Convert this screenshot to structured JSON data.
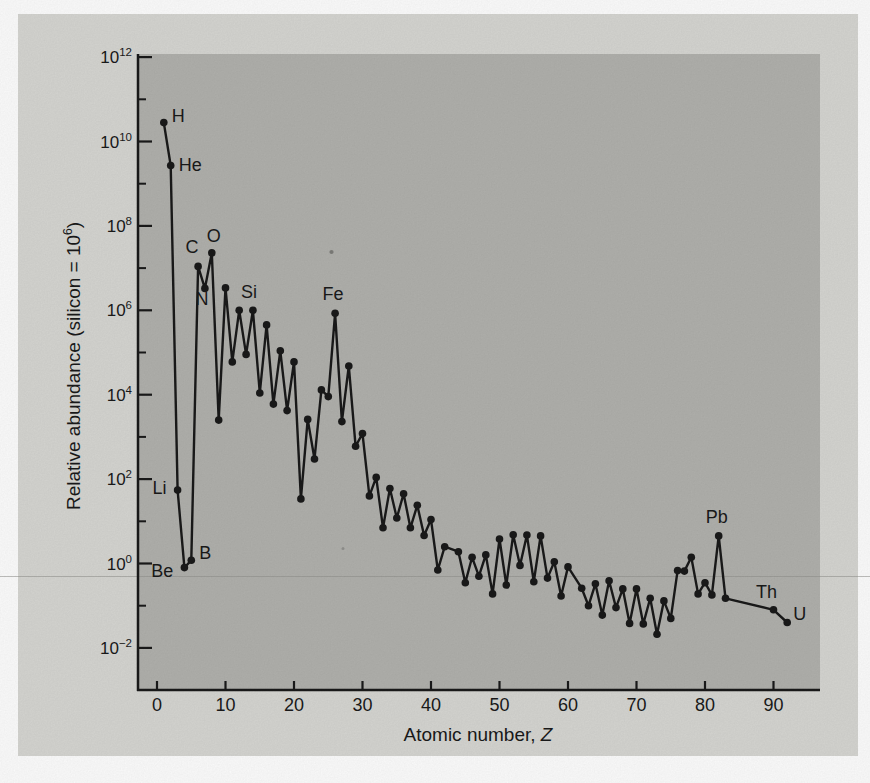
{
  "figure": {
    "kind": "scanned-textbook-figure",
    "colors": {
      "canvas": "#fdfdfd",
      "page": "#d6d6d2",
      "plot": "#b1b1ad",
      "ink": "#1a1a1a",
      "scan_line": "#90908c"
    }
  },
  "chart_data": {
    "type": "line",
    "markers": "filled-circle",
    "title": "",
    "xlabel": "Atomic number, Z",
    "xlabel_parts": {
      "prefix": "Atomic number, ",
      "italic": "Z"
    },
    "ylabel": "Relative abundance (silicon = 10⁶)",
    "ylabel_parts": {
      "prefix": "Relative abundance (silicon = 10",
      "sup": "6",
      "suffix": ")"
    },
    "x_axis": {
      "min": 0,
      "max": 96,
      "tick_interval": 10,
      "ticks": [
        0,
        10,
        20,
        30,
        40,
        50,
        60,
        70,
        80,
        90
      ]
    },
    "y_axis": {
      "scale": "log",
      "base": 10,
      "min": 0.01,
      "max": 1000000000000.0,
      "major_tick_exponents": [
        12,
        10,
        8,
        6,
        4,
        2,
        0,
        -2
      ],
      "minor_tick_exponents": [
        11,
        9,
        7,
        5,
        3,
        1,
        -1
      ]
    },
    "legend": "none",
    "grid": "off",
    "omitted_z": [
      43,
      61,
      84,
      85,
      86,
      87,
      88,
      89,
      91
    ],
    "points": [
      {
        "z": 1,
        "symbol": "H",
        "value": 28000000000.0,
        "label": {
          "anchor": "start",
          "dx": 8,
          "dy": -1
        }
      },
      {
        "z": 2,
        "symbol": "He",
        "value": 2700000000.0,
        "label": {
          "anchor": "start",
          "dx": 8,
          "dy": 5
        }
      },
      {
        "z": 3,
        "symbol": "Li",
        "value": 55,
        "label": {
          "anchor": "end",
          "dx": -11,
          "dy": 4
        }
      },
      {
        "z": 4,
        "symbol": "Be",
        "value": 0.8,
        "label": {
          "anchor": "end",
          "dx": -11,
          "dy": 9
        }
      },
      {
        "z": 5,
        "symbol": "B",
        "value": 1.2,
        "label": {
          "anchor": "start",
          "dx": 8,
          "dy": -1
        }
      },
      {
        "z": 6,
        "symbol": "C",
        "value": 11000000.0,
        "label": {
          "anchor": "middle",
          "dx": -6,
          "dy": -13
        }
      },
      {
        "z": 7,
        "symbol": "N",
        "value": 3300000.0,
        "label": {
          "anchor": "middle",
          "dx": -3,
          "dy": 17
        }
      },
      {
        "z": 8,
        "symbol": "O",
        "value": 23000000.0,
        "label": {
          "anchor": "middle",
          "dx": 2,
          "dy": -11
        }
      },
      {
        "z": 9,
        "symbol": "F",
        "value": 2500
      },
      {
        "z": 10,
        "symbol": "Ne",
        "value": 3400000.0
      },
      {
        "z": 11,
        "symbol": "Na",
        "value": 60000
      },
      {
        "z": 12,
        "symbol": "Mg",
        "value": 1000000.0
      },
      {
        "z": 13,
        "symbol": "Al",
        "value": 90000
      },
      {
        "z": 14,
        "symbol": "Si",
        "value": 1000000.0,
        "label": {
          "anchor": "middle",
          "dx": -4,
          "dy": -12
        }
      },
      {
        "z": 15,
        "symbol": "P",
        "value": 11000
      },
      {
        "z": 16,
        "symbol": "S",
        "value": 450000
      },
      {
        "z": 17,
        "symbol": "Cl",
        "value": 6000
      },
      {
        "z": 18,
        "symbol": "Ar",
        "value": 110000
      },
      {
        "z": 19,
        "symbol": "K",
        "value": 4200
      },
      {
        "z": 20,
        "symbol": "Ca",
        "value": 60000
      },
      {
        "z": 21,
        "symbol": "Sc",
        "value": 34
      },
      {
        "z": 22,
        "symbol": "Ti",
        "value": 2600
      },
      {
        "z": 23,
        "symbol": "V",
        "value": 300
      },
      {
        "z": 24,
        "symbol": "Cr",
        "value": 13000
      },
      {
        "z": 25,
        "symbol": "Mn",
        "value": 9000
      },
      {
        "z": 26,
        "symbol": "Fe",
        "value": 850000.0,
        "label": {
          "anchor": "middle",
          "dx": -2,
          "dy": -13
        }
      },
      {
        "z": 27,
        "symbol": "Co",
        "value": 2300
      },
      {
        "z": 28,
        "symbol": "Ni",
        "value": 48000
      },
      {
        "z": 29,
        "symbol": "Cu",
        "value": 600
      },
      {
        "z": 30,
        "symbol": "Zn",
        "value": 1200
      },
      {
        "z": 31,
        "symbol": "Ga",
        "value": 40
      },
      {
        "z": 32,
        "symbol": "Ge",
        "value": 110
      },
      {
        "z": 33,
        "symbol": "As",
        "value": 7
      },
      {
        "z": 34,
        "symbol": "Se",
        "value": 60
      },
      {
        "z": 35,
        "symbol": "Br",
        "value": 12
      },
      {
        "z": 36,
        "symbol": "Kr",
        "value": 45
      },
      {
        "z": 37,
        "symbol": "Rb",
        "value": 7
      },
      {
        "z": 38,
        "symbol": "Sr",
        "value": 24
      },
      {
        "z": 39,
        "symbol": "Y",
        "value": 4.6
      },
      {
        "z": 40,
        "symbol": "Zr",
        "value": 11
      },
      {
        "z": 41,
        "symbol": "Nb",
        "value": 0.7
      },
      {
        "z": 42,
        "symbol": "Mo",
        "value": 2.5
      },
      {
        "z": 44,
        "symbol": "Ru",
        "value": 1.9
      },
      {
        "z": 45,
        "symbol": "Rh",
        "value": 0.35
      },
      {
        "z": 46,
        "symbol": "Pd",
        "value": 1.4
      },
      {
        "z": 47,
        "symbol": "Ag",
        "value": 0.5
      },
      {
        "z": 48,
        "symbol": "Cd",
        "value": 1.6
      },
      {
        "z": 49,
        "symbol": "In",
        "value": 0.19
      },
      {
        "z": 50,
        "symbol": "Sn",
        "value": 3.8
      },
      {
        "z": 51,
        "symbol": "Sb",
        "value": 0.31
      },
      {
        "z": 52,
        "symbol": "Te",
        "value": 4.8
      },
      {
        "z": 53,
        "symbol": "I",
        "value": 0.9
      },
      {
        "z": 54,
        "symbol": "Xe",
        "value": 4.7
      },
      {
        "z": 55,
        "symbol": "Cs",
        "value": 0.37
      },
      {
        "z": 56,
        "symbol": "Ba",
        "value": 4.5
      },
      {
        "z": 57,
        "symbol": "La",
        "value": 0.45
      },
      {
        "z": 58,
        "symbol": "Ce",
        "value": 1.1
      },
      {
        "z": 59,
        "symbol": "Pr",
        "value": 0.17
      },
      {
        "z": 60,
        "symbol": "Nd",
        "value": 0.83
      },
      {
        "z": 62,
        "symbol": "Sm",
        "value": 0.26
      },
      {
        "z": 63,
        "symbol": "Eu",
        "value": 0.1
      },
      {
        "z": 64,
        "symbol": "Gd",
        "value": 0.33
      },
      {
        "z": 65,
        "symbol": "Tb",
        "value": 0.06
      },
      {
        "z": 66,
        "symbol": "Dy",
        "value": 0.39
      },
      {
        "z": 67,
        "symbol": "Ho",
        "value": 0.09
      },
      {
        "z": 68,
        "symbol": "Er",
        "value": 0.25
      },
      {
        "z": 69,
        "symbol": "Tm",
        "value": 0.038
      },
      {
        "z": 70,
        "symbol": "Yb",
        "value": 0.25
      },
      {
        "z": 71,
        "symbol": "Lu",
        "value": 0.037
      },
      {
        "z": 72,
        "symbol": "Hf",
        "value": 0.15
      },
      {
        "z": 73,
        "symbol": "Ta",
        "value": 0.021
      },
      {
        "z": 74,
        "symbol": "W",
        "value": 0.13
      },
      {
        "z": 75,
        "symbol": "Re",
        "value": 0.05
      },
      {
        "z": 76,
        "symbol": "Os",
        "value": 0.68
      },
      {
        "z": 77,
        "symbol": "Ir",
        "value": 0.66
      },
      {
        "z": 78,
        "symbol": "Pt",
        "value": 1.4
      },
      {
        "z": 79,
        "symbol": "Au",
        "value": 0.19
      },
      {
        "z": 80,
        "symbol": "Hg",
        "value": 0.35
      },
      {
        "z": 81,
        "symbol": "Tl",
        "value": 0.18
      },
      {
        "z": 82,
        "symbol": "Pb",
        "value": 4.5,
        "label": {
          "anchor": "middle",
          "dx": -2,
          "dy": -13
        }
      },
      {
        "z": 83,
        "symbol": "Bi",
        "value": 0.15
      },
      {
        "z": 90,
        "symbol": "Th",
        "value": 0.08,
        "label": {
          "anchor": "middle",
          "dx": -7,
          "dy": -12
        }
      },
      {
        "z": 92,
        "symbol": "U",
        "value": 0.04,
        "label": {
          "anchor": "start",
          "dx": 6,
          "dy": -3
        }
      }
    ]
  }
}
